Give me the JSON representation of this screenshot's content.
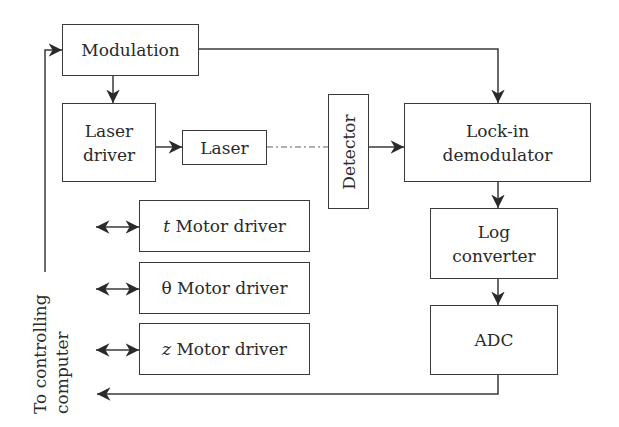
{
  "blocks": {
    "modulation": "Modulation",
    "laser_driver": [
      "Laser",
      "driver"
    ],
    "laser": "Laser",
    "detector": "Detector",
    "lockin": [
      "Lock-in",
      "demodulator"
    ],
    "log_converter": [
      "Log",
      "converter"
    ],
    "adc": "ADC",
    "t_motor": {
      "var": "t",
      "label": "Motor driver"
    },
    "theta_motor": {
      "var": "θ",
      "label": "Motor driver"
    },
    "z_motor": {
      "var": "z",
      "label": "Motor driver"
    }
  },
  "side_label": [
    "To controlling",
    "computer"
  ],
  "colors": {
    "line": "#3a3a3a",
    "dashed": "#8a9a9a"
  }
}
